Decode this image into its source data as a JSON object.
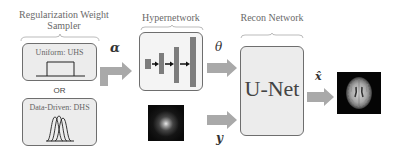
{
  "diagram": {
    "sampler": {
      "title_line1": "Regularization Weight",
      "title_line2": "Sampler",
      "uniform_label": "Uniform: UHS",
      "or_label": "OR",
      "datadriven_label": "Data-Driven: DHS"
    },
    "hypernetwork": {
      "title": "Hypernetwork"
    },
    "recon": {
      "title": "Recon Network",
      "unet_label": "U-Net"
    },
    "symbols": {
      "alpha": "α",
      "theta": "θ",
      "y": "y",
      "xhat": "x̂"
    },
    "colors": {
      "arrow": "#a9a9a9",
      "bar": "#7d7d7d",
      "box_border": "#6e6e6e",
      "box_fill": "#ececec"
    }
  }
}
